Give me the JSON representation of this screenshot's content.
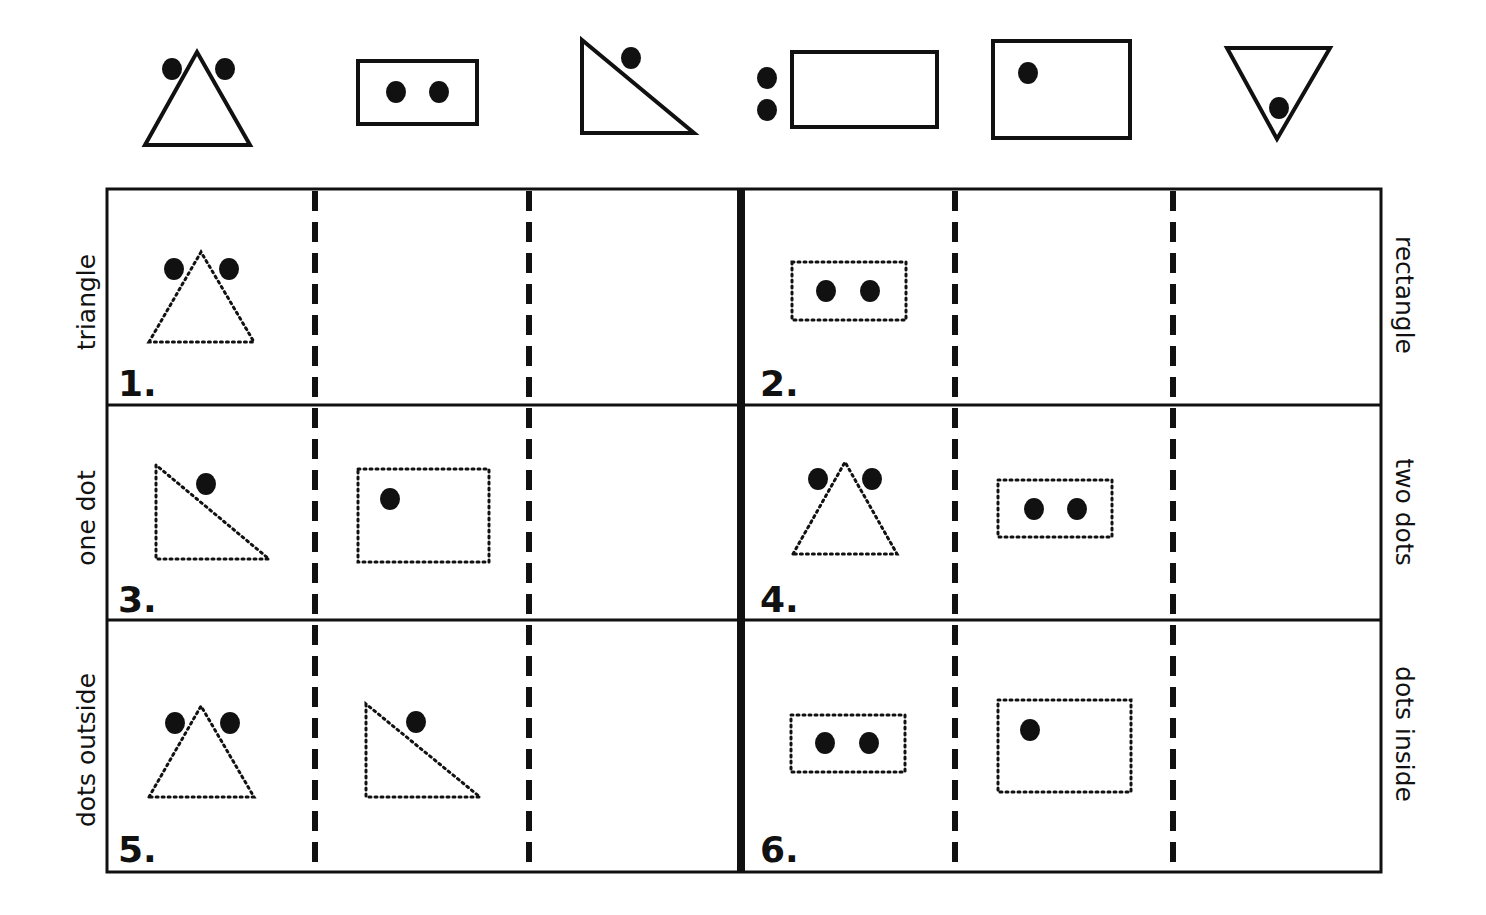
{
  "palette": {
    "ink": "#111111",
    "paper": "#ffffff"
  },
  "sample_shapes": [
    {
      "id": "triangle-two-dots-outside",
      "shape": "triangle-up",
      "dots": 2,
      "dot_position": "outside-top",
      "border": "solid"
    },
    {
      "id": "rectangle-two-dots-inside",
      "shape": "rectangle",
      "dots": 2,
      "dot_position": "inside",
      "border": "solid"
    },
    {
      "id": "right-triangle-one-dot-outside",
      "shape": "right-triangle",
      "dots": 1,
      "dot_position": "outside-hypotenuse",
      "border": "solid"
    },
    {
      "id": "rectangle-two-dots-outside",
      "shape": "rectangle",
      "dots": 2,
      "dot_position": "outside-left",
      "border": "solid"
    },
    {
      "id": "rectangle-one-dot-inside",
      "shape": "rectangle",
      "dots": 1,
      "dot_position": "inside",
      "border": "solid"
    },
    {
      "id": "triangle-down-one-dot-inside",
      "shape": "triangle-down",
      "dots": 1,
      "dot_position": "inside",
      "border": "solid"
    }
  ],
  "row_labels_left": [
    "triangle",
    "one dot",
    "dots outside"
  ],
  "row_labels_right": [
    "rectangle",
    "two dots",
    "dots inside"
  ],
  "puzzles": [
    {
      "number": "1.",
      "rule": "triangle",
      "given": [
        "triangle-two-dots-outside"
      ],
      "answer_slots": 2
    },
    {
      "number": "2.",
      "rule": "rectangle",
      "given": [
        "rectangle-two-dots-inside"
      ],
      "answer_slots": 2
    },
    {
      "number": "3.",
      "rule": "one dot",
      "given": [
        "right-triangle-one-dot-outside",
        "rectangle-one-dot-inside"
      ],
      "answer_slots": 1
    },
    {
      "number": "4.",
      "rule": "two dots",
      "given": [
        "triangle-two-dots-outside",
        "rectangle-two-dots-inside"
      ],
      "answer_slots": 1
    },
    {
      "number": "5.",
      "rule": "dots outside",
      "given": [
        "triangle-two-dots-outside",
        "right-triangle-one-dot-outside"
      ],
      "answer_slots": 1
    },
    {
      "number": "6.",
      "rule": "dots inside",
      "given": [
        "rectangle-two-dots-inside",
        "rectangle-one-dot-inside"
      ],
      "answer_slots": 1
    }
  ]
}
